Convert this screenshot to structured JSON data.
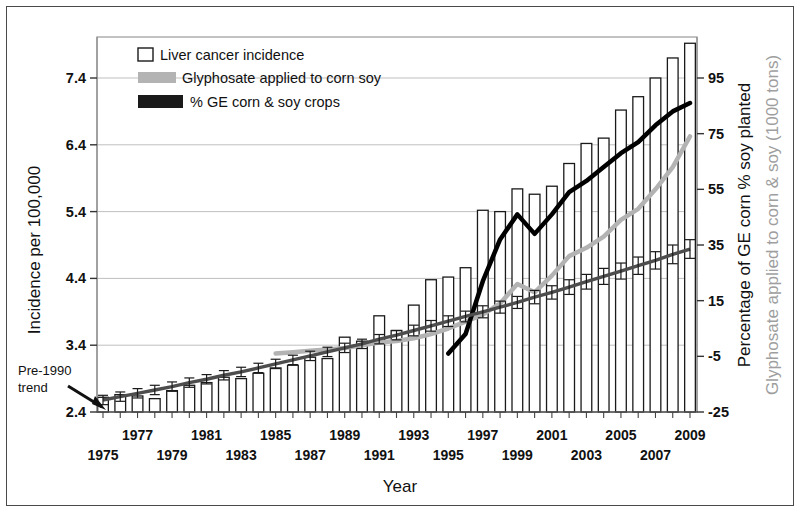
{
  "figure": {
    "background": "#ffffff",
    "frame_color": "#4a4a4a"
  },
  "colors": {
    "bar_outline": "#1a1a1a",
    "bar_fill": "#ffffff",
    "trend_line": "#4d4d4d",
    "glyphosate_line": "#b3b3b3",
    "ge_line": "#000000",
    "grid": "#bfbfbf",
    "axis": "#555555",
    "text": "#111111",
    "right_axis_secondary_text": "#9e9e9e"
  },
  "chart_data": {
    "type": "bar",
    "title": "",
    "xlabel": "Year",
    "ylabel": "Incidence per 100,000",
    "ylabel_right_primary": "Percentage of GE corn % soy planted",
    "ylabel_right_secondary": "Glyphosate applied to corn & soy (1000 tons)",
    "grid": true,
    "legend_position": "top-left-inside",
    "ylim": [
      2.4,
      7.95
    ],
    "yticks": [
      "2.4",
      "3.4",
      "4.4",
      "5.4",
      "6.4",
      "7.4"
    ],
    "ytick_values": [
      2.4,
      3.4,
      4.4,
      5.4,
      6.4,
      7.4
    ],
    "ylim_right": [
      -25,
      95
    ],
    "yticks_right": [
      "-25",
      "-5",
      "15",
      "35",
      "55",
      "75",
      "95"
    ],
    "ytick_values_right": [
      -25,
      -5,
      15,
      35,
      55,
      75,
      95
    ],
    "xlim": [
      1975,
      2009
    ],
    "x": [
      1975,
      1976,
      1977,
      1978,
      1979,
      1980,
      1981,
      1982,
      1983,
      1984,
      1985,
      1986,
      1987,
      1988,
      1989,
      1990,
      1991,
      1992,
      1993,
      1994,
      1995,
      1996,
      1997,
      1998,
      1999,
      2000,
      2001,
      2002,
      2003,
      2004,
      2005,
      2006,
      2007,
      2008,
      2009
    ],
    "xticks_top_row": [
      "1977",
      "1981",
      "1985",
      "1989",
      "1993",
      "1997",
      "2001",
      "2005",
      "2009"
    ],
    "xticks_bottom_row": [
      "1975",
      "1979",
      "1983",
      "1987",
      "1991",
      "1995",
      "1999",
      "2003",
      "2007"
    ],
    "series": [
      {
        "name": "Liver cancer incidence",
        "type": "bar",
        "axis": "left",
        "values": [
          2.62,
          2.66,
          2.64,
          2.6,
          2.72,
          2.8,
          2.84,
          2.92,
          2.9,
          2.98,
          3.06,
          3.1,
          3.22,
          3.2,
          3.52,
          3.46,
          3.84,
          3.62,
          4.0,
          4.38,
          4.42,
          4.56,
          5.42,
          5.4,
          5.74,
          5.66,
          5.78,
          6.12,
          6.42,
          6.5,
          6.92,
          7.12,
          7.4,
          7.7,
          7.92
        ]
      },
      {
        "name": "Pre-1990 trend",
        "type": "line-with-error-bars",
        "axis": "left",
        "values": [
          2.58,
          2.63,
          2.68,
          2.73,
          2.78,
          2.84,
          2.89,
          2.95,
          3.0,
          3.06,
          3.12,
          3.18,
          3.24,
          3.3,
          3.36,
          3.42,
          3.49,
          3.55,
          3.62,
          3.69,
          3.76,
          3.83,
          3.9,
          3.97,
          4.04,
          4.12,
          4.19,
          4.27,
          4.35,
          4.43,
          4.51,
          4.59,
          4.67,
          4.76,
          4.84
        ],
        "errors": [
          0.07,
          0.07,
          0.07,
          0.07,
          0.07,
          0.07,
          0.07,
          0.07,
          0.07,
          0.07,
          0.07,
          0.07,
          0.07,
          0.07,
          0.07,
          0.07,
          0.07,
          0.07,
          0.08,
          0.08,
          0.08,
          0.08,
          0.09,
          0.09,
          0.09,
          0.1,
          0.1,
          0.11,
          0.11,
          0.12,
          0.12,
          0.13,
          0.13,
          0.14,
          0.14
        ]
      },
      {
        "name": "Glyphosate applied to corn soy",
        "type": "line",
        "axis": "right",
        "units": "1000 tons",
        "values": [
          null,
          null,
          null,
          null,
          null,
          null,
          null,
          null,
          null,
          null,
          -4,
          -3.5,
          -3,
          -2.5,
          -2,
          -1,
          0,
          0.5,
          1.5,
          3,
          5,
          7.5,
          10,
          14,
          21,
          18,
          24,
          31,
          34,
          38,
          44,
          48,
          55,
          63,
          74
        ]
      },
      {
        "name": "% GE corn & soy crops",
        "type": "line",
        "axis": "right",
        "units": "percent",
        "values": [
          null,
          null,
          null,
          null,
          null,
          null,
          null,
          null,
          null,
          null,
          null,
          null,
          null,
          null,
          null,
          null,
          null,
          null,
          null,
          null,
          -4,
          3,
          22,
          37,
          46,
          39,
          46,
          54,
          58,
          63,
          68,
          72,
          78,
          83,
          86
        ]
      }
    ]
  },
  "legend": {
    "items": [
      {
        "label": "Liver cancer incidence",
        "marker": "open-square",
        "color": "#ffffff"
      },
      {
        "label": "Glyphosate applied to corn soy",
        "marker": "filled-rect",
        "color": "#b3b3b3"
      },
      {
        "label": "% GE corn & soy crops",
        "marker": "filled-rect",
        "color": "#1a1a1a"
      }
    ]
  },
  "annotations": [
    {
      "name": "pre-1990-trend",
      "line1": "Pre-1990",
      "line2": "trend"
    }
  ]
}
